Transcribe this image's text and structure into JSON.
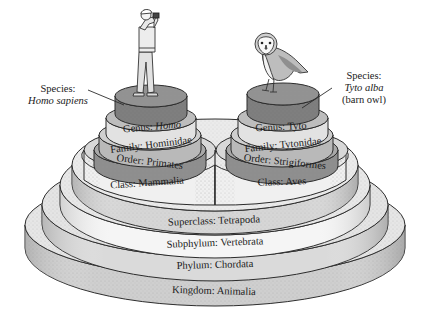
{
  "colors": {
    "background": "#ffffff",
    "outline": "#2b2b2b",
    "kingdom_band": "#cfcfcf",
    "phylum_band": "#dadada",
    "subphylum_band": "#f4f4f4",
    "superclass_band": "#d6d6d6",
    "class_band": "#efefef",
    "order_band": "#8e8e8e",
    "family_band": "#b9b9b9",
    "genus_band": "#e2e2e2",
    "species_top": "#7d7d7d",
    "stipple": "#9a9a9a"
  },
  "shared_levels": [
    {
      "rank": "Kingdom",
      "taxon": "Animalia",
      "label": "Kingdom: Animalia"
    },
    {
      "rank": "Phylum",
      "taxon": "Chordata",
      "label": "Phylum: Chordata"
    },
    {
      "rank": "Subphylum",
      "taxon": "Vertebrata",
      "label": "Subphylum: Vertebrata"
    },
    {
      "rank": "Superclass",
      "taxon": "Tetrapoda",
      "label": "Superclass: Tetrapoda"
    }
  ],
  "left_stack": {
    "organism": "human",
    "class": {
      "prefix": "Class: ",
      "name": "Mammalia"
    },
    "order": {
      "prefix": "Order: ",
      "name": "Primates"
    },
    "family": {
      "prefix": "Family: ",
      "name": "Hominidae"
    },
    "genus": {
      "prefix": "Genus: ",
      "name": "Homo"
    },
    "species": {
      "heading": "Species:",
      "name": "Homo sapiens"
    }
  },
  "right_stack": {
    "organism": "barn owl",
    "class": {
      "prefix": "Class: ",
      "name": "Aves"
    },
    "order": {
      "prefix": "Order: ",
      "name": "Strigiformes"
    },
    "family": {
      "prefix": "Family: ",
      "name": "Tytonidae"
    },
    "genus": {
      "prefix": "Genus: ",
      "name": "Tyto"
    },
    "species": {
      "heading": "Species:",
      "name": "Tyto alba",
      "common": "(barn owl)"
    }
  }
}
